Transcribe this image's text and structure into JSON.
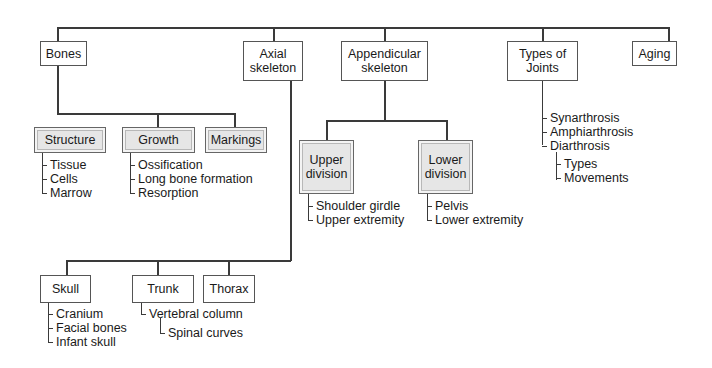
{
  "diagram": {
    "root_children": [
      {
        "id": "bones",
        "label": "Bones"
      },
      {
        "id": "axial",
        "label": "Axial\nskeleton"
      },
      {
        "id": "appendicular",
        "label": "Appendicular\nskeleton"
      },
      {
        "id": "joints",
        "label": "Types of\nJoints"
      },
      {
        "id": "aging",
        "label": "Aging"
      }
    ],
    "bones": {
      "structure": {
        "label": "Structure",
        "items": [
          "Tissue",
          "Cells",
          "Marrow"
        ]
      },
      "growth": {
        "label": "Growth",
        "items": [
          "Ossification",
          "Long bone formation",
          "Resorption"
        ]
      },
      "markings": {
        "label": "Markings"
      }
    },
    "appendicular": {
      "upper": {
        "label": "Upper\ndivision",
        "items": [
          "Shoulder girdle",
          "Upper extremity"
        ]
      },
      "lower": {
        "label": "Lower\ndivision",
        "items": [
          "Pelvis",
          "Lower extremity"
        ]
      }
    },
    "joints": {
      "items": [
        "Synarthrosis",
        "Amphiarthrosis",
        "Diarthrosis"
      ],
      "diarthrosis_items": [
        "Types",
        "Movements"
      ]
    },
    "axial": {
      "skull": {
        "label": "Skull",
        "items": [
          "Cranium",
          "Facial bones",
          "Infant skull"
        ]
      },
      "trunk": {
        "label": "Trunk",
        "items": [
          "Vertebral column"
        ],
        "sub_items": [
          "Spinal curves"
        ]
      },
      "thorax": {
        "label": "Thorax"
      }
    }
  }
}
